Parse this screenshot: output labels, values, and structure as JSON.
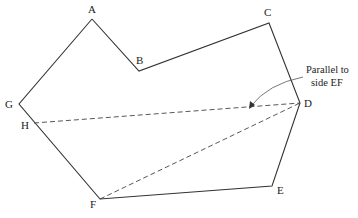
{
  "diagram": {
    "type": "polygon-construction",
    "vertices": [
      {
        "id": "A",
        "label": "A"
      },
      {
        "id": "B",
        "label": "B"
      },
      {
        "id": "C",
        "label": "C"
      },
      {
        "id": "D",
        "label": "D"
      },
      {
        "id": "E",
        "label": "E"
      },
      {
        "id": "F",
        "label": "F"
      },
      {
        "id": "G",
        "label": "G"
      },
      {
        "id": "H",
        "label": "H"
      }
    ],
    "solid_edges": [
      "A-B",
      "B-C",
      "C-D",
      "D-E",
      "E-F",
      "F-G",
      "G-A"
    ],
    "dashed_lines": [
      "H-D",
      "F-D"
    ],
    "annotation": {
      "line1": "Parallel to",
      "line2": "side EF"
    },
    "colors": {
      "line": "#333333",
      "text": "#222222",
      "background": "#ffffff"
    }
  }
}
